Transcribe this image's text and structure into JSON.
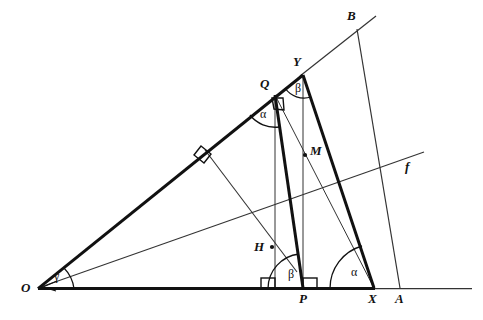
{
  "figure": {
    "type": "geometry-diagram",
    "background_color": "#ffffff",
    "stroke_color": "#111111",
    "canvas": {
      "width": 483,
      "height": 320
    }
  },
  "points": [
    {
      "id": "O",
      "label": "O",
      "x": 38,
      "y": 289,
      "label_x": 21,
      "label_y": 282,
      "kind": "vertex"
    },
    {
      "id": "P",
      "label": "P",
      "x": 303,
      "y": 289,
      "label_x": 299,
      "label_y": 293,
      "kind": "vertex"
    },
    {
      "id": "X",
      "label": "X",
      "x": 374,
      "y": 289,
      "label_x": 369,
      "label_y": 293,
      "kind": "vertex"
    },
    {
      "id": "A",
      "label": "A",
      "x": 400,
      "y": 289,
      "label_x": 396,
      "label_y": 293,
      "kind": "vertex"
    },
    {
      "id": "Q",
      "label": "Q",
      "x": 275,
      "y": 95,
      "label_x": 261,
      "label_y": 78,
      "kind": "vertex"
    },
    {
      "id": "Y",
      "label": "Y",
      "x": 303,
      "y": 75,
      "label_x": 294,
      "label_y": 56,
      "kind": "vertex"
    },
    {
      "id": "B",
      "label": "B",
      "x": 357,
      "y": 29,
      "label_x": 348,
      "label_y": 10,
      "kind": "vertex"
    },
    {
      "id": "H",
      "label": "H",
      "x": 272,
      "y": 247,
      "label_x": 255,
      "label_y": 241,
      "kind": "foot-of-perpendicular"
    },
    {
      "id": "M",
      "label": "M",
      "x": 305,
      "y": 155,
      "label_x": 310,
      "label_y": 145,
      "kind": "midpoint"
    }
  ],
  "line_labels": [
    {
      "id": "f",
      "label": "f",
      "x": 405,
      "y": 162
    }
  ],
  "angle_labels": [
    {
      "id": "gamma-at-O",
      "label": "γ",
      "x": 54,
      "y": 276
    },
    {
      "id": "alpha-at-Q",
      "label": "α",
      "x": 261,
      "y": 109
    },
    {
      "id": "beta-at-Y",
      "label": "β",
      "x": 296,
      "y": 83
    },
    {
      "id": "beta-at-P",
      "label": "β",
      "x": 289,
      "y": 273
    },
    {
      "id": "alpha-at-X",
      "label": "α",
      "x": 352,
      "y": 271
    }
  ],
  "segments": [
    {
      "id": "base-ray-thick",
      "from": "O",
      "to": "X",
      "weight": "thick"
    },
    {
      "id": "base-ray-thin",
      "from": "X",
      "to": "right-edge",
      "weight": "thin"
    },
    {
      "id": "upper-ray-thick",
      "from": "O",
      "to": "Y",
      "weight": "thick"
    },
    {
      "id": "upper-ray-thin",
      "from": "Y",
      "to": "beyond-B",
      "weight": "thin"
    },
    {
      "id": "line-f",
      "from": "O",
      "to": "f-end",
      "weight": "thin"
    },
    {
      "id": "segment-QP",
      "from": "Q",
      "to": "P",
      "weight": "thick"
    },
    {
      "id": "segment-YX",
      "from": "Y",
      "to": "X",
      "weight": "thick"
    },
    {
      "id": "segment-QX",
      "from": "Q",
      "to": "X",
      "weight": "thin"
    },
    {
      "id": "segment-YP",
      "from": "Y",
      "to": "P",
      "weight": "thin"
    },
    {
      "id": "vertical-from-Q",
      "from": "Q",
      "to": "base",
      "weight": "thin"
    },
    {
      "id": "perpendicular-Y-to-OQ",
      "from": "Y",
      "to": "H-extended",
      "weight": "thin"
    },
    {
      "id": "segment-BA",
      "from": "B",
      "to": "A",
      "weight": "thin"
    }
  ],
  "right_angle_marks": [
    {
      "id": "right-angle-on-OQ",
      "x": 207,
      "y": 152
    },
    {
      "id": "right-angle-at-Q",
      "x": 281,
      "y": 101
    },
    {
      "id": "right-angle-at-foot-of-Q-vertical",
      "x": 265,
      "y": 284
    },
    {
      "id": "right-angle-at-P",
      "x": 305,
      "y": 284
    }
  ]
}
